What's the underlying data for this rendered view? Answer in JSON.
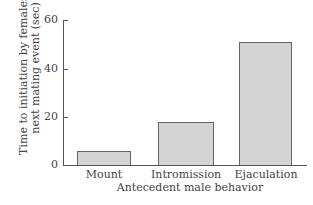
{
  "chart_data": {
    "type": "bar",
    "title": "",
    "categories": [
      "Mount",
      "Intromission",
      "Ejaculation"
    ],
    "values": [
      6,
      18,
      51
    ],
    "xlabel": "Antecedent male behavior",
    "ylabel_line1": "Time to initiation by females of",
    "ylabel_line2": "next mating event (sec)",
    "ylabel": "Time to initiation by females of next mating event (sec)",
    "ylim": [
      0,
      60
    ],
    "yticks": [
      "0",
      "20",
      "40",
      "60"
    ],
    "grid": false,
    "bar_color": "#d4d4d4"
  }
}
